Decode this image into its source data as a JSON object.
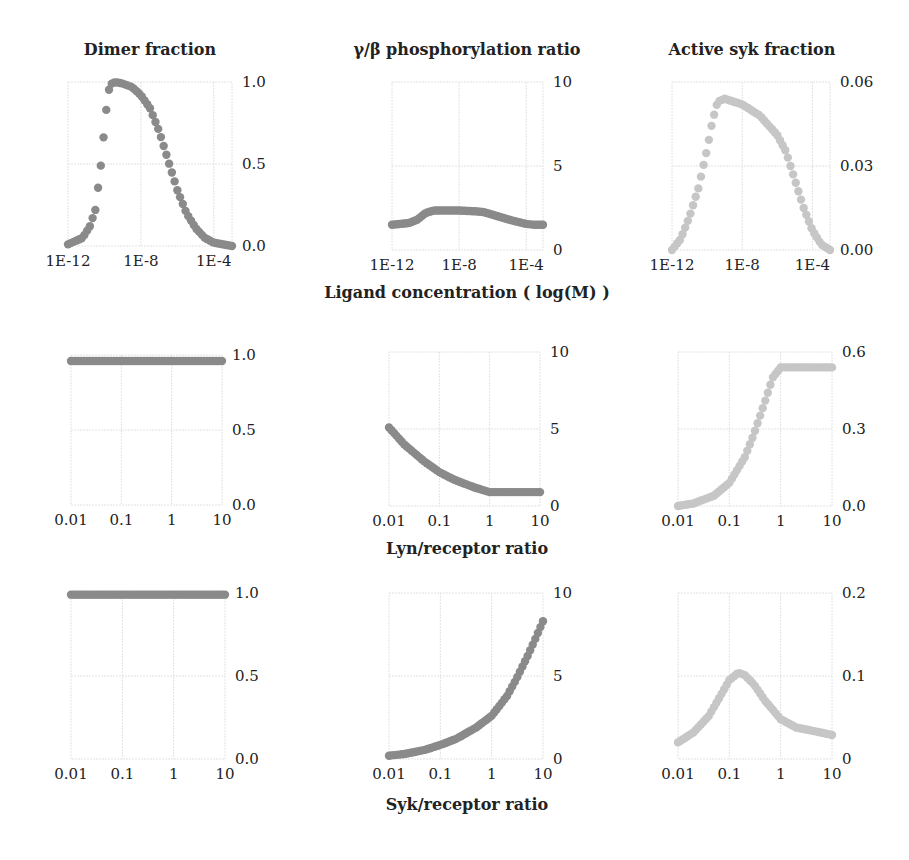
{
  "colors": {
    "dark_marker": "#8a8a8a",
    "light_marker": "#c6c6c6",
    "grid": "#e2e2e2"
  },
  "column_titles": [
    "Dimer fraction",
    "γ/β phosphorylation ratio",
    "Active syk fraction"
  ],
  "row_axis_titles": [
    "Ligand concentration ( log(M) )",
    "Lyn/receptor ratio",
    "Syk/receptor ratio"
  ],
  "chart_data": [
    {
      "id": "r1c1",
      "type": "scatter",
      "title": "Dimer fraction",
      "xlabel": "Ligand concentration ( log(M) )",
      "xscale": "log",
      "xlim": [
        -12,
        -3
      ],
      "xticks": [
        "1E-12",
        "1E-8",
        "1E-4"
      ],
      "xtick_vals": [
        -12,
        -8,
        -4
      ],
      "ylim": [
        0,
        1
      ],
      "yticks": [
        "0.0",
        "0.5",
        "1.0"
      ],
      "ytick_vals": [
        0,
        0.5,
        1
      ],
      "color": "dark",
      "grid": true,
      "yaxis_position": "right",
      "x": [
        -12,
        -11.2,
        -10.8,
        -10.5,
        -10.2,
        -10.0,
        -9.8,
        -9.6,
        -9.4,
        -9.0,
        -8.5,
        -8.0,
        -7.5,
        -7.0,
        -6.5,
        -6.0,
        -5.5,
        -5.0,
        -4.5,
        -4.0,
        -3.5,
        -3.0
      ],
      "y": [
        0.01,
        0.05,
        0.12,
        0.22,
        0.49,
        0.72,
        0.94,
        0.99,
        1.0,
        0.99,
        0.97,
        0.92,
        0.84,
        0.7,
        0.52,
        0.34,
        0.2,
        0.11,
        0.05,
        0.02,
        0.01,
        0.0
      ]
    },
    {
      "id": "r1c2",
      "type": "scatter",
      "title": "γ/β phosphorylation ratio",
      "xlabel": "Ligand concentration ( log(M) )",
      "xscale": "log",
      "xlim": [
        -12,
        -3
      ],
      "xticks": [
        "1E-12",
        "1E-8",
        "1E-4"
      ],
      "xtick_vals": [
        -12,
        -8,
        -4
      ],
      "ylim": [
        0,
        10
      ],
      "yticks": [
        "0",
        "5",
        "10"
      ],
      "ytick_vals": [
        0,
        5,
        10
      ],
      "color": "dark",
      "grid": true,
      "yaxis_position": "right",
      "x": [
        -12,
        -11,
        -10.5,
        -10,
        -9.5,
        -9,
        -8,
        -7,
        -6.5,
        -6,
        -5,
        -4,
        -3.5,
        -3
      ],
      "y": [
        1.5,
        1.6,
        1.8,
        2.2,
        2.35,
        2.35,
        2.35,
        2.3,
        2.25,
        2.1,
        1.8,
        1.55,
        1.5,
        1.5
      ]
    },
    {
      "id": "r1c3",
      "type": "scatter",
      "title": "Active syk fraction",
      "xlabel": "Ligand concentration ( log(M) )",
      "xscale": "log",
      "xlim": [
        -12,
        -3
      ],
      "xticks": [
        "1E-12",
        "1E-8",
        "1E-4"
      ],
      "xtick_vals": [
        -12,
        -8,
        -4
      ],
      "ylim": [
        0,
        0.06
      ],
      "yticks": [
        "0.00",
        "0.03",
        "0.06"
      ],
      "ytick_vals": [
        0,
        0.03,
        0.06
      ],
      "color": "light",
      "grid": true,
      "yaxis_position": "right",
      "x": [
        -12,
        -11.5,
        -11,
        -10.5,
        -10,
        -9.7,
        -9.4,
        -9,
        -8,
        -7,
        -6,
        -5.5,
        -5,
        -4.5,
        -4,
        -3.5,
        -3
      ],
      "y": [
        0.0,
        0.004,
        0.012,
        0.022,
        0.036,
        0.046,
        0.053,
        0.054,
        0.052,
        0.048,
        0.041,
        0.035,
        0.025,
        0.015,
        0.007,
        0.002,
        0.0
      ]
    },
    {
      "id": "r2c1",
      "type": "scatter",
      "xlabel": "Lyn/receptor ratio",
      "xscale": "log",
      "xlim": [
        0.01,
        10
      ],
      "xticks": [
        "0.01",
        "0.1",
        "1",
        "10"
      ],
      "xtick_vals": [
        0.01,
        0.1,
        1,
        10
      ],
      "ylim": [
        0,
        1
      ],
      "yticks": [
        "0.0",
        "0.5",
        "1.0"
      ],
      "ytick_vals": [
        0,
        0.5,
        1
      ],
      "color": "dark",
      "grid": true,
      "yaxis_position": "right",
      "x": [
        0.01,
        0.1,
        1,
        10
      ],
      "y": [
        0.96,
        0.96,
        0.96,
        0.96
      ]
    },
    {
      "id": "r2c2",
      "type": "scatter",
      "xlabel": "Lyn/receptor ratio",
      "xscale": "log",
      "xlim": [
        0.01,
        10
      ],
      "xticks": [
        "0.01",
        "0.1",
        "1",
        "10"
      ],
      "xtick_vals": [
        0.01,
        0.1,
        1,
        10
      ],
      "ylim": [
        0,
        10
      ],
      "yticks": [
        "0",
        "5",
        "10"
      ],
      "ytick_vals": [
        0,
        5,
        10
      ],
      "color": "dark",
      "grid": true,
      "yaxis_position": "right",
      "x": [
        0.01,
        0.02,
        0.05,
        0.1,
        0.2,
        0.5,
        1,
        2,
        5,
        10
      ],
      "y": [
        5.1,
        4.0,
        2.9,
        2.2,
        1.7,
        1.2,
        0.9,
        0.9,
        0.9,
        0.9
      ]
    },
    {
      "id": "r2c3",
      "type": "scatter",
      "xlabel": "Lyn/receptor ratio",
      "xscale": "log",
      "xlim": [
        0.01,
        10
      ],
      "xticks": [
        "0.01",
        "0.1",
        "1",
        "10"
      ],
      "xtick_vals": [
        0.01,
        0.1,
        1,
        10
      ],
      "ylim": [
        0,
        0.6
      ],
      "yticks": [
        "0.0",
        "0.3",
        "0.6"
      ],
      "ytick_vals": [
        0,
        0.3,
        0.6
      ],
      "color": "light",
      "grid": true,
      "yaxis_position": "right",
      "x": [
        0.01,
        0.02,
        0.05,
        0.1,
        0.2,
        0.3,
        0.5,
        0.7,
        1,
        2,
        5,
        10
      ],
      "y": [
        0.0,
        0.01,
        0.04,
        0.09,
        0.19,
        0.28,
        0.41,
        0.5,
        0.54,
        0.54,
        0.54,
        0.54
      ]
    },
    {
      "id": "r3c1",
      "type": "scatter",
      "xlabel": "Syk/receptor ratio",
      "xscale": "log",
      "xlim": [
        0.01,
        10
      ],
      "xticks": [
        "0.01",
        "0.1",
        "1",
        "10"
      ],
      "xtick_vals": [
        0.01,
        0.1,
        1,
        10
      ],
      "ylim": [
        0,
        1
      ],
      "yticks": [
        "0.0",
        "0.5",
        "1.0"
      ],
      "ytick_vals": [
        0,
        0.5,
        1
      ],
      "color": "dark",
      "grid": true,
      "yaxis_position": "right",
      "x": [
        0.01,
        0.1,
        1,
        10
      ],
      "y": [
        0.99,
        0.99,
        0.99,
        0.99
      ]
    },
    {
      "id": "r3c2",
      "type": "scatter",
      "xlabel": "Syk/receptor ratio",
      "xscale": "log",
      "xlim": [
        0.01,
        10
      ],
      "xticks": [
        "0.01",
        "0.1",
        "1",
        "10"
      ],
      "xtick_vals": [
        0.01,
        0.1,
        1,
        10
      ],
      "ylim": [
        0,
        10
      ],
      "yticks": [
        "0",
        "5",
        "10"
      ],
      "ytick_vals": [
        0,
        5,
        10
      ],
      "color": "dark",
      "grid": true,
      "yaxis_position": "right",
      "x": [
        0.01,
        0.02,
        0.05,
        0.1,
        0.2,
        0.5,
        1,
        2,
        3,
        5,
        7,
        10
      ],
      "y": [
        0.2,
        0.3,
        0.55,
        0.85,
        1.2,
        1.9,
        2.6,
        3.8,
        4.8,
        6.2,
        7.2,
        8.3
      ]
    },
    {
      "id": "r3c3",
      "type": "scatter",
      "xlabel": "Syk/receptor ratio",
      "xscale": "log",
      "xlim": [
        0.01,
        10
      ],
      "xticks": [
        "0.01",
        "0.1",
        "1",
        "10"
      ],
      "xtick_vals": [
        0.01,
        0.1,
        1,
        10
      ],
      "ylim": [
        0,
        0.2
      ],
      "yticks": [
        "0",
        "0.1",
        "0.2"
      ],
      "ytick_vals": [
        0,
        0.1,
        0.2
      ],
      "color": "light",
      "grid": true,
      "yaxis_position": "right",
      "x": [
        0.01,
        0.02,
        0.04,
        0.07,
        0.1,
        0.15,
        0.2,
        0.3,
        0.5,
        1,
        2,
        5,
        10
      ],
      "y": [
        0.02,
        0.032,
        0.052,
        0.078,
        0.095,
        0.104,
        0.101,
        0.09,
        0.07,
        0.048,
        0.038,
        0.033,
        0.029
      ]
    }
  ]
}
